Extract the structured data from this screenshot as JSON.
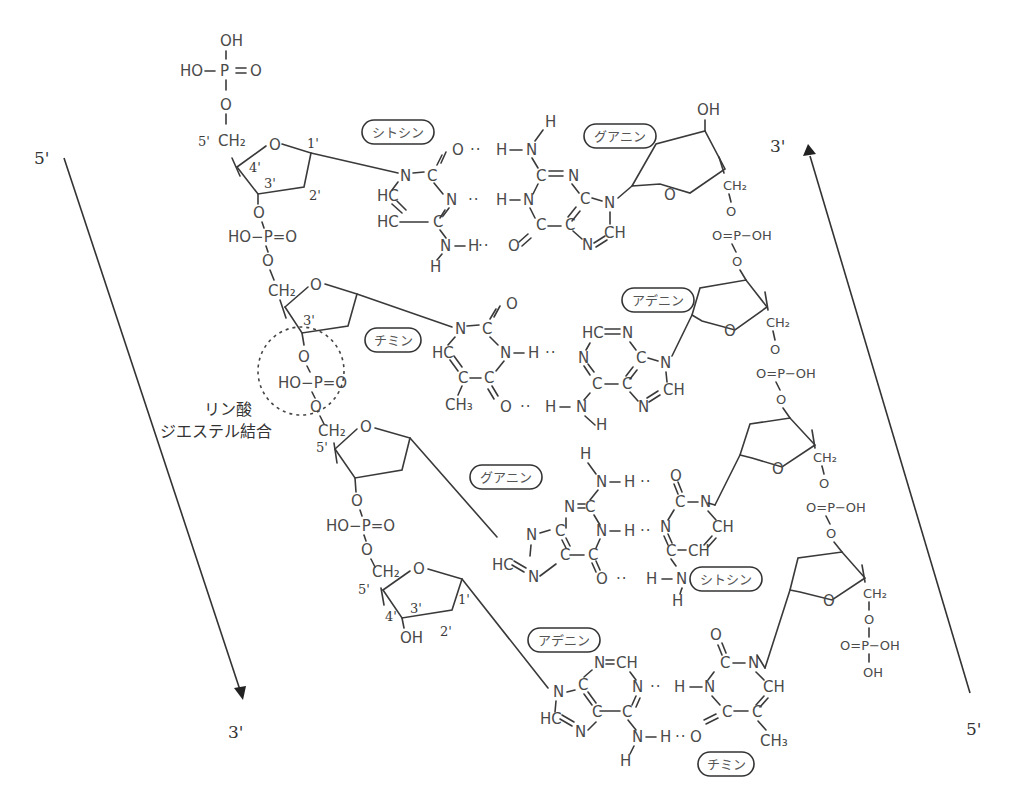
{
  "strand_ends": {
    "left_top": "5'",
    "left_bottom": "3'",
    "right_top": "3'",
    "right_bottom": "5'"
  },
  "annotation": {
    "line1": "リン酸",
    "line2": "ジエステル結合"
  },
  "bases": {
    "left": [
      "シトシン",
      "チミン",
      "グアニン",
      "アデニン"
    ],
    "right": [
      "グアニン",
      "アデニン",
      "シトシン",
      "チミン"
    ]
  },
  "atoms": {
    "OH": "OH",
    "HO": "HO",
    "P": "P",
    "O": "O",
    "N": "N",
    "C": "C",
    "H": "H",
    "HC": "HC",
    "CH": "CH",
    "CH2": "CH₂",
    "CH3": "CH₃",
    "HO_P_O": "HO−P=O",
    "O_P_OH": "O=P−OH",
    "HO_dash": "HO −",
    "eq_O": "= O"
  },
  "sugar_positions": {
    "p1": "1'",
    "p2": "2'",
    "p3": "3'",
    "p4": "4'",
    "p5": "5'"
  },
  "hbonds": {
    "dots": "··"
  }
}
